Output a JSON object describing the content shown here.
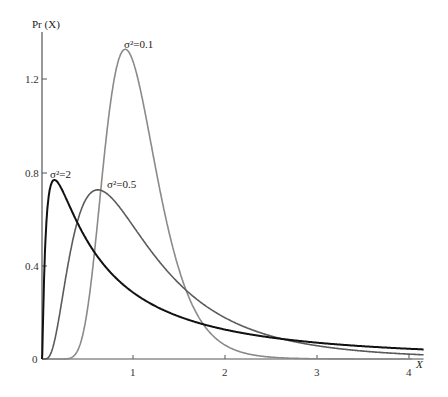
{
  "chart_data": {
    "type": "line",
    "title": "",
    "xlabel": "X",
    "ylabel": "Pr (X)",
    "xlim": [
      0,
      4.15
    ],
    "ylim": [
      0,
      1.4
    ],
    "x_ticks": [
      1,
      2,
      3,
      4
    ],
    "x_tick_labels": [
      "1",
      "2",
      "3",
      "4"
    ],
    "y_ticks": [
      0,
      0.4,
      0.8,
      1.2
    ],
    "y_tick_labels": [
      "0",
      "0.4",
      "0.8",
      "1.2"
    ],
    "grid": false,
    "legend": "none (curves annotated inline)",
    "series": [
      {
        "name": "σ²=0.1",
        "sigma2": 0.1,
        "color": "#8a8a8a",
        "width": 1.6,
        "peak_x": 0.95,
        "peak_y": 1.32,
        "x": [
          0.3,
          0.5,
          0.7,
          0.8,
          0.9,
          0.95,
          1.0,
          1.1,
          1.2,
          1.4,
          1.6,
          1.8,
          2.0,
          2.5,
          3.0
        ],
        "values": [
          0.0,
          0.15,
          0.63,
          0.97,
          1.24,
          1.3,
          1.26,
          1.07,
          0.83,
          0.42,
          0.18,
          0.07,
          0.03,
          0.0,
          0.0
        ]
      },
      {
        "name": "σ²=0.5",
        "sigma2": 0.5,
        "color": "#5a5a5a",
        "width": 1.6,
        "peak_x": 0.67,
        "peak_y": 0.71,
        "x": [
          0.1,
          0.2,
          0.4,
          0.6,
          0.7,
          0.8,
          1.0,
          1.5,
          2.0,
          2.5,
          3.0,
          4.0
        ],
        "values": [
          0.05,
          0.27,
          0.63,
          0.72,
          0.71,
          0.69,
          0.56,
          0.36,
          0.21,
          0.13,
          0.08,
          0.03
        ]
      },
      {
        "name": "σ²=2",
        "sigma2": 2,
        "color": "#111111",
        "width": 2.0,
        "peak_x": 0.15,
        "peak_y": 0.76,
        "x": [
          0.02,
          0.05,
          0.1,
          0.15,
          0.2,
          0.4,
          0.6,
          1.0,
          1.5,
          2.0,
          3.0,
          4.0
        ],
        "values": [
          0.18,
          0.58,
          0.76,
          0.76,
          0.74,
          0.58,
          0.46,
          0.28,
          0.18,
          0.12,
          0.06,
          0.04
        ]
      }
    ],
    "annotations": [
      {
        "text": "σ²=0.1",
        "x": 0.9,
        "y": 1.36
      },
      {
        "text": "σ²=0.5",
        "x": 0.7,
        "y": 0.73
      },
      {
        "text": "σ²=2",
        "x": 0.05,
        "y": 0.78
      }
    ]
  },
  "labels": {
    "y_axis_title": "Pr (X)",
    "x_axis_title": "X",
    "origin": "0",
    "x1": "1",
    "x2": "2",
    "x3": "3",
    "x4": "4",
    "y04": "0.4",
    "y08": "0.8",
    "y12": "1.2",
    "ann_01": "σ²=0.1",
    "ann_05": "σ²=0.5",
    "ann_2": "σ²=2"
  }
}
